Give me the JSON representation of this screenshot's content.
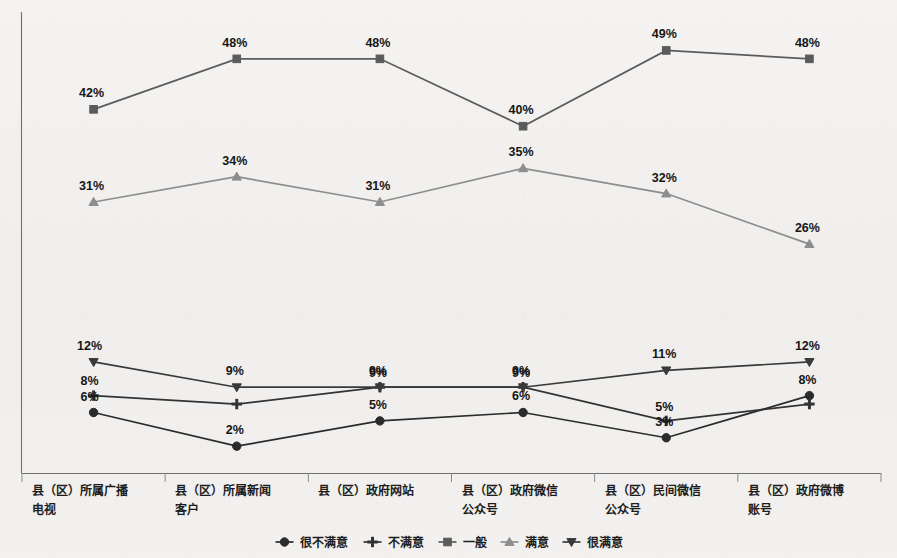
{
  "chart_data": {
    "type": "line",
    "title": "",
    "subtitle": "",
    "xlabel": "",
    "ylabel": "",
    "ylim": [
      0,
      55
    ],
    "grid": false,
    "legend_position": "bottom",
    "value_suffix": "%",
    "categories": [
      "县（区）所属广播电视",
      "县（区）所属新闻客户",
      "县（区）政府网站",
      "县（区）政府微信公众号",
      "县（区）民间微信公众号",
      "县（区）政府微博账号"
    ],
    "series": [
      {
        "name": "很不满意",
        "marker": "circle",
        "color": "#2b2b2b",
        "values": [
          6,
          2,
          5,
          6,
          3,
          8
        ],
        "labels": [
          "6%",
          "2%",
          "5%",
          "6%",
          "3%",
          "8%"
        ]
      },
      {
        "name": "不满意",
        "marker": "plus",
        "color": "#333333",
        "values": [
          8,
          7,
          9,
          9,
          5,
          7
        ],
        "labels": [
          "8%",
          "",
          "9%",
          "9%",
          "5%",
          ""
        ]
      },
      {
        "name": "一般",
        "marker": "square",
        "color": "#5b5b5b",
        "values": [
          42,
          48,
          48,
          40,
          49,
          48
        ],
        "labels": [
          "42%",
          "48%",
          "48%",
          "40%",
          "49%",
          "48%"
        ]
      },
      {
        "name": "满意",
        "marker": "triangle",
        "color": "#8d8d8d",
        "values": [
          31,
          34,
          31,
          35,
          32,
          26
        ],
        "labels": [
          "31%",
          "34%",
          "31%",
          "35%",
          "32%",
          "26%"
        ]
      },
      {
        "name": "很满意",
        "marker": "inverted-triangle",
        "color": "#3a3a3a",
        "values": [
          12,
          9,
          9,
          9,
          11,
          12
        ],
        "labels": [
          "12%",
          "9%",
          "9%",
          "9%",
          "11%",
          "12%"
        ]
      }
    ]
  },
  "legend": {
    "items": [
      {
        "label": "很不满意",
        "marker": "circle"
      },
      {
        "label": "不满意",
        "marker": "plus"
      },
      {
        "label": "一般",
        "marker": "square"
      },
      {
        "label": "满意",
        "marker": "triangle"
      },
      {
        "label": "很满意",
        "marker": "inverted-triangle"
      }
    ]
  },
  "colors": {
    "axis": "#6f6f6f",
    "label_text": "#161616",
    "background": "#f2f1ef"
  }
}
